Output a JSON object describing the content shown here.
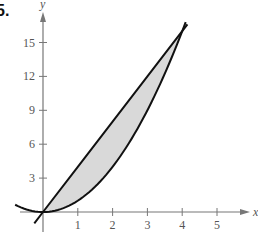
{
  "problem": {
    "label": "5."
  },
  "chart_data": {
    "type": "area",
    "title": "",
    "xlabel": "x",
    "ylabel": "y",
    "xlim": [
      -1,
      6
    ],
    "ylim": [
      -1.5,
      17.5
    ],
    "x_ticks": [
      1,
      2,
      3,
      4,
      5
    ],
    "y_ticks": [
      3,
      6,
      9,
      12,
      15
    ],
    "grid": false,
    "legend": null,
    "series": [
      {
        "name": "line y = 4x",
        "x": [
          -0.25,
          0,
          1,
          2,
          3,
          4,
          4.15
        ],
        "y": [
          -1,
          0,
          4,
          8,
          12,
          16,
          16.6
        ]
      },
      {
        "name": "parabola y = x^2",
        "x": [
          -0.8,
          -0.5,
          0,
          1,
          2,
          3,
          4,
          4.1
        ],
        "y": [
          0.64,
          0.25,
          0,
          1,
          4,
          9,
          16,
          16.8
        ]
      }
    ],
    "shaded_region": {
      "between": [
        "line y = 4x",
        "parabola y = x^2"
      ],
      "x_range": [
        0,
        4
      ],
      "fill": "#d9d9d9"
    },
    "intersections": [
      [
        0,
        0
      ],
      [
        4,
        16
      ]
    ]
  },
  "colors": {
    "axis": "#777777",
    "curve": "#111111",
    "fill": "#d9d9d9",
    "text": "#555555"
  }
}
